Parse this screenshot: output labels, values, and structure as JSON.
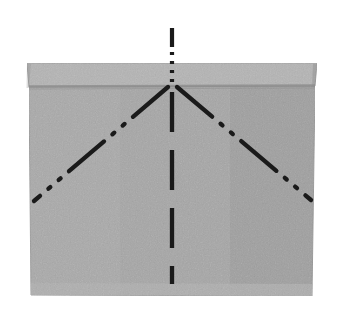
{
  "figure": {
    "title": "",
    "caption": "",
    "domain_note": "technical line drawing of a folded bag / pouch with top flap band and fold lines",
    "canvas": {
      "width": 339,
      "height": 322,
      "background": "#ffffff"
    },
    "colors": {
      "background": "#ffffff",
      "body_fill": "#a6a6a6",
      "flap_fill": "#b4b4b4",
      "bottom_band_fill": "#b0b0b0",
      "fold_line": "#8a8a8a",
      "outline": "#9a9a9a",
      "dash_line": "#1a1a1a"
    },
    "parts": [
      {
        "name": "top-flap-band",
        "label": "",
        "fill": "#b4b4b4",
        "points": "27,63 317,63 315,86 29,87"
      },
      {
        "name": "bag-body",
        "label": "",
        "fill": "#a6a6a6",
        "points": "29,87 315,86 312,296 31,295"
      },
      {
        "name": "bottom-seam-band",
        "label": "",
        "fill": "#b0b0b0",
        "points": "31,283 312,284 312,296 31,295"
      }
    ],
    "lines": [
      {
        "name": "center-vertical-fold",
        "style": "dashed",
        "x1": 172,
        "y1": 28,
        "x2": 172,
        "y2": 284,
        "width": 4,
        "dasharray": "18 10",
        "color": "#1a1a1a",
        "note": "upper segment above flap rendered as dash-dot"
      },
      {
        "name": "left-diagonal-fold",
        "style": "dash-dot-dot",
        "x1": 167,
        "y1": 86,
        "x2": 34,
        "y2": 200,
        "width": 4,
        "dasharray": "34 10 2 10 2 10",
        "color": "#1a1a1a"
      },
      {
        "name": "right-diagonal-fold",
        "style": "dash-dot-dot",
        "x1": 177,
        "y1": 86,
        "x2": 311,
        "y2": 199,
        "width": 4,
        "dasharray": "34 10 2 10 2 10",
        "color": "#1a1a1a"
      },
      {
        "name": "flap-fold-edge",
        "style": "solid",
        "x1": 29,
        "y1": 86,
        "x2": 315,
        "y2": 85,
        "width": 2,
        "dasharray": "",
        "color": "#8a8a8a"
      }
    ],
    "reference_numbers": []
  }
}
